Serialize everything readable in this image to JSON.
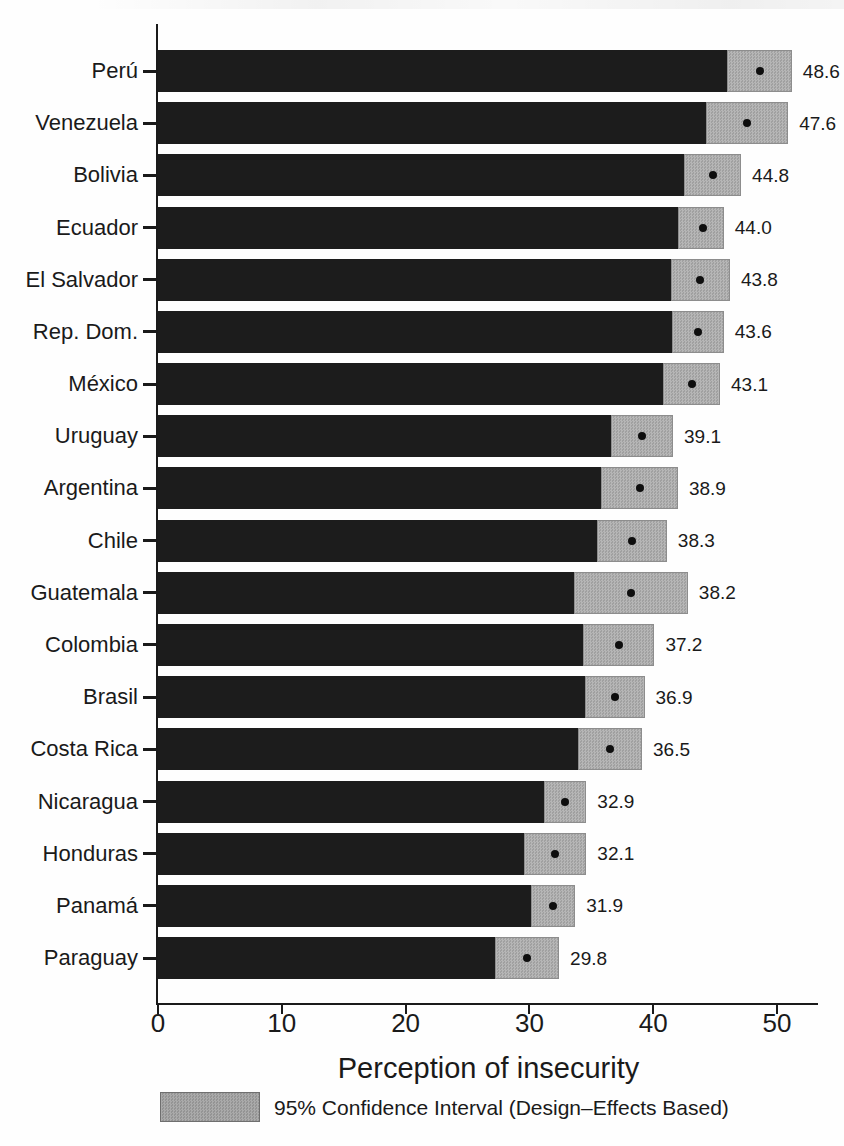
{
  "figure": {
    "xlabel": "Perception of insecurity",
    "legend_label": "95% Confidence Interval (Design–Effects Based)"
  },
  "colors": {
    "bar": "#1c1c1c",
    "ci_fill": "#ababab",
    "ci_border": "#8d8d8d",
    "dot": "#0e0e0e",
    "axis": "#1a1a1a",
    "background": "#fefefe"
  },
  "chart_data": {
    "type": "bar",
    "orientation": "horizontal",
    "title": "",
    "xlabel": "Perception of insecurity",
    "ylabel": "",
    "xlim": [
      0,
      53.3
    ],
    "x_ticks": [
      0,
      10,
      20,
      30,
      40,
      50
    ],
    "grid": false,
    "legend": {
      "label": "95% Confidence Interval (Design–Effects Based)",
      "position": "bottom"
    },
    "categories": [
      "Perú",
      "Venezuela",
      "Bolivia",
      "Ecuador",
      "El Salvador",
      "Rep. Dom.",
      "México",
      "Uruguay",
      "Argentina",
      "Chile",
      "Guatemala",
      "Colombia",
      "Brasil",
      "Costa Rica",
      "Nicaragua",
      "Honduras",
      "Panamá",
      "Paraguay"
    ],
    "values": [
      48.6,
      47.6,
      44.8,
      44.0,
      43.8,
      43.6,
      43.1,
      39.1,
      38.9,
      38.3,
      38.2,
      37.2,
      36.9,
      36.5,
      32.9,
      32.1,
      31.9,
      29.8
    ],
    "value_labels": [
      "48.6",
      "47.6",
      "44.8",
      "44.0",
      "43.8",
      "43.6",
      "43.1",
      "39.1",
      "38.9",
      "38.3",
      "38.2",
      "37.2",
      "36.9",
      "36.5",
      "32.9",
      "32.1",
      "31.9",
      "29.8"
    ],
    "ci_lower": [
      46.0,
      44.3,
      42.5,
      42.0,
      41.4,
      41.5,
      40.8,
      36.6,
      35.8,
      35.5,
      33.6,
      34.3,
      34.5,
      33.9,
      31.2,
      29.6,
      30.1,
      27.2
    ],
    "ci_upper": [
      51.2,
      50.9,
      47.1,
      45.7,
      46.2,
      45.7,
      45.4,
      41.6,
      42.0,
      41.1,
      42.8,
      40.1,
      39.3,
      39.1,
      34.6,
      34.6,
      33.7,
      32.4
    ]
  }
}
